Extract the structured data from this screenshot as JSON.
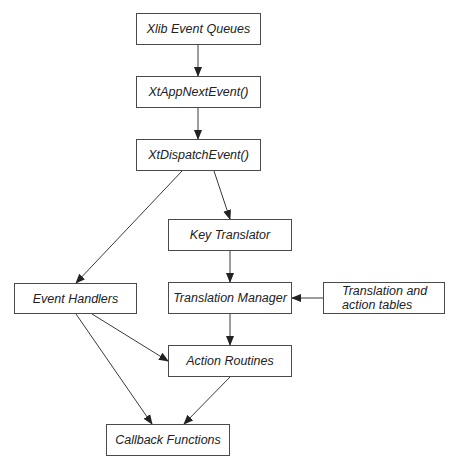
{
  "diagram": {
    "nodes": [
      {
        "id": "xlib",
        "label": "Xlib Event Queues"
      },
      {
        "id": "next",
        "label": "XtAppNextEvent()"
      },
      {
        "id": "dispatch",
        "label": "XtDispatchEvent()"
      },
      {
        "id": "key",
        "label": "Key Translator"
      },
      {
        "id": "handlers",
        "label": "Event Handlers"
      },
      {
        "id": "manager",
        "label": "Translation Manager"
      },
      {
        "id": "tables",
        "label": "Translation and action tables"
      },
      {
        "id": "actions",
        "label": "Action Routines"
      },
      {
        "id": "callbacks",
        "label": "Callback Functions"
      }
    ],
    "edges": [
      {
        "from": "xlib",
        "to": "next"
      },
      {
        "from": "next",
        "to": "dispatch"
      },
      {
        "from": "dispatch",
        "to": "handlers"
      },
      {
        "from": "dispatch",
        "to": "key"
      },
      {
        "from": "key",
        "to": "manager"
      },
      {
        "from": "tables",
        "to": "manager"
      },
      {
        "from": "manager",
        "to": "actions"
      },
      {
        "from": "handlers",
        "to": "actions"
      },
      {
        "from": "handlers",
        "to": "callbacks"
      },
      {
        "from": "actions",
        "to": "callbacks"
      }
    ],
    "colors": {
      "line": "#3a3a3a",
      "border": "#4a4a4a",
      "text": "#222222",
      "background": "#ffffff"
    }
  }
}
